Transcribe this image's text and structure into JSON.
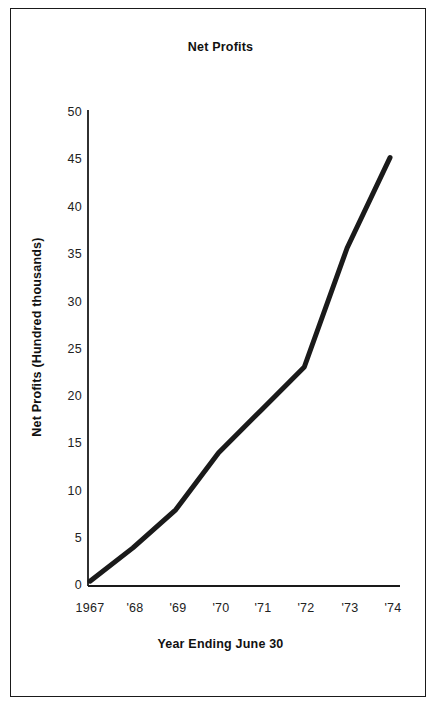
{
  "figure": {
    "border_color": "#1a1a1a",
    "background": "#ffffff"
  },
  "chart_data": {
    "type": "line",
    "title": "Net Profits",
    "xlabel": "Year Ending June 30",
    "ylabel": "Net Profits  (Hundred thousands)",
    "categories": [
      "1967",
      "'68",
      "'69",
      "'70",
      "'71",
      "'72",
      "'73",
      "'74"
    ],
    "x": [
      1967,
      1968,
      1969,
      1970,
      1971,
      1972,
      1973,
      1974
    ],
    "values": [
      0.5,
      4,
      8,
      14,
      18.5,
      23,
      35.5,
      45
    ],
    "series": [
      {
        "name": "Net Profits",
        "values": [
          0.5,
          4,
          8,
          14,
          18.5,
          23,
          35.5,
          45
        ],
        "color": "#1a1a1a",
        "line_width": 5
      }
    ],
    "ylim": [
      0,
      50
    ],
    "yticks": [
      0,
      5,
      10,
      15,
      20,
      25,
      30,
      35,
      40,
      45,
      50
    ],
    "ytick_labels": [
      "0",
      "5",
      "10",
      "15",
      "20",
      "25",
      "30",
      "35",
      "40",
      "45",
      "50"
    ],
    "xtick_labels": [
      "1967",
      "'68",
      "'69",
      "'70",
      "'71",
      "'72",
      "'73",
      "'74"
    ],
    "grid": false,
    "legend": false,
    "axis_color": "#1a1a1a"
  }
}
